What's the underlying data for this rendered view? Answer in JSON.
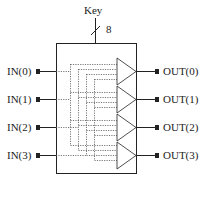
{
  "diagram": {
    "key": {
      "label": "Key",
      "bus_width": "8"
    },
    "inputs": [
      {
        "label": "IN(0)"
      },
      {
        "label": "IN(1)"
      },
      {
        "label": "IN(2)"
      },
      {
        "label": "IN(3)"
      }
    ],
    "outputs": [
      {
        "label": "OUT(0)"
      },
      {
        "label": "OUT(1)"
      },
      {
        "label": "OUT(2)"
      },
      {
        "label": "OUT(3)"
      }
    ],
    "colors": {
      "line": "#222222",
      "dotted": "#555555",
      "background": "#ffffff"
    }
  }
}
